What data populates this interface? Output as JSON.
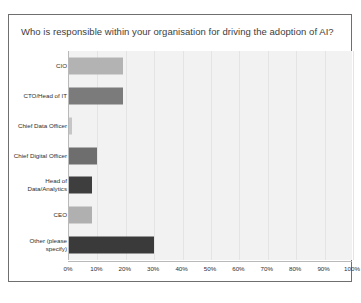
{
  "card": {
    "title": "Who is responsible within your organisation for driving the adoption of AI?"
  },
  "chart_data": {
    "type": "bar",
    "orientation": "horizontal",
    "title": "Who is responsible within your organisation for driving the adoption of AI?",
    "xlabel": "",
    "ylabel": "",
    "xlim": [
      0,
      100
    ],
    "xunit": "%",
    "grid": true,
    "legend": false,
    "categories": [
      "CIO",
      "CTO/Head of IT",
      "Chief Data Officer",
      "Chief Digital Officer",
      "Head of Data/Analytics",
      "CEO",
      "Other (please specify)"
    ],
    "values": [
      19,
      19,
      1,
      10,
      8,
      8,
      30
    ],
    "bar_colors": [
      "#b3b3b3",
      "#7b7b7b",
      "#c6c6c6",
      "#6e6e6e",
      "#3e3e3e",
      "#b0b0b0",
      "#3a3a3a"
    ],
    "tick_labels": [
      "0%",
      "10%",
      "20%",
      "30%",
      "40%",
      "50%",
      "60%",
      "70%",
      "80%",
      "90%",
      "100%"
    ],
    "tick_values": [
      0,
      10,
      20,
      30,
      40,
      50,
      60,
      70,
      80,
      90,
      100
    ],
    "plot_background": "#f2f2f2",
    "gridline_color": "#e4e4e4",
    "axis_color": "#b9b9b9"
  }
}
